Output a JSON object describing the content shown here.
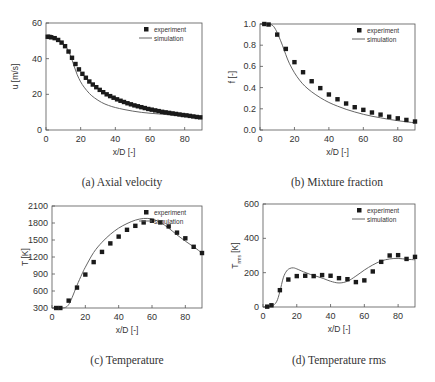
{
  "chart_data": [
    {
      "id": "a",
      "type": "scatter+line",
      "title": "",
      "caption": "(a) Axial velocity",
      "xlabel": "x/D [-]",
      "ylabel": "u [m/s]",
      "xlim": [
        0,
        90
      ],
      "ylim": [
        0,
        60
      ],
      "xticks": [
        0,
        20,
        40,
        60,
        80
      ],
      "yticks": [
        0,
        20,
        40,
        60
      ],
      "grid": false,
      "legend_position": "upper right",
      "series": [
        {
          "name": "experiment",
          "style": "square-markers",
          "x": [
            1,
            2,
            3,
            5,
            7,
            9,
            11,
            13,
            15,
            17,
            19,
            21,
            23,
            25,
            27,
            29,
            31,
            33,
            35,
            37,
            39,
            41,
            43,
            45,
            47,
            49,
            51,
            53,
            55,
            57,
            59,
            61,
            63,
            65,
            67,
            69,
            71,
            73,
            75,
            77,
            79,
            81,
            83,
            85,
            87,
            89
          ],
          "values": [
            52.3,
            52.2,
            52,
            51.5,
            50.5,
            49,
            47,
            44,
            40.5,
            37,
            34,
            31.5,
            29.3,
            27.2,
            25.5,
            24,
            22.5,
            21.2,
            20,
            19,
            18.1,
            17.2,
            16.4,
            15.7,
            15,
            14.4,
            13.8,
            13.3,
            12.8,
            12.3,
            11.8,
            11.4,
            11,
            10.6,
            10.2,
            9.9,
            9.6,
            9.3,
            9,
            8.7,
            8.4,
            8.2,
            7.9,
            7.6,
            7.3,
            7.1
          ]
        },
        {
          "name": "simulation",
          "style": "line",
          "x": [
            0,
            4,
            8,
            10,
            12,
            14,
            16,
            18,
            20,
            22,
            25,
            28,
            32,
            36,
            40,
            45,
            50,
            55,
            60,
            65,
            70,
            75,
            80,
            85,
            90
          ],
          "values": [
            52.5,
            52,
            50,
            48.5,
            46,
            42,
            36.5,
            31,
            27,
            24,
            20.5,
            18,
            15.5,
            13.8,
            12.6,
            11.5,
            10.6,
            9.9,
            9.4,
            9,
            8.6,
            8.2,
            7.8,
            7.4,
            7
          ]
        }
      ]
    },
    {
      "id": "b",
      "type": "scatter+line",
      "title": "",
      "caption": "(b) Mixture fraction",
      "xlabel": "x/D [-]",
      "ylabel": "f [-]",
      "xlim": [
        0,
        90
      ],
      "ylim": [
        0.0,
        1.0
      ],
      "xticks": [
        0,
        20,
        40,
        60,
        80
      ],
      "yticks": [
        0.0,
        0.2,
        0.4,
        0.6,
        0.8,
        1.0
      ],
      "grid": false,
      "legend_position": "upper right",
      "series": [
        {
          "name": "experiment",
          "style": "square-markers",
          "x": [
            2.5,
            5,
            10,
            15,
            20,
            25,
            30,
            35,
            40,
            45,
            50,
            55,
            60,
            65,
            70,
            75,
            80,
            85,
            90
          ],
          "values": [
            1.0,
            0.995,
            0.9,
            0.765,
            0.64,
            0.545,
            0.46,
            0.395,
            0.335,
            0.29,
            0.25,
            0.215,
            0.19,
            0.165,
            0.145,
            0.125,
            0.11,
            0.095,
            0.08
          ]
        },
        {
          "name": "simulation",
          "style": "line",
          "x": [
            0,
            4,
            7,
            9,
            11,
            13,
            15,
            17,
            20,
            23,
            26,
            30,
            35,
            40,
            45,
            50,
            55,
            60,
            65,
            70,
            75,
            80,
            85,
            90
          ],
          "values": [
            1.0,
            1.0,
            0.99,
            0.95,
            0.88,
            0.8,
            0.71,
            0.63,
            0.54,
            0.47,
            0.415,
            0.36,
            0.305,
            0.26,
            0.225,
            0.195,
            0.17,
            0.148,
            0.13,
            0.115,
            0.1,
            0.088,
            0.077,
            0.068
          ]
        }
      ]
    },
    {
      "id": "c",
      "type": "scatter+line",
      "title": "",
      "caption": "(c) Temperature",
      "xlabel": "x/D [-]",
      "ylabel": "T [K]",
      "xlim": [
        0,
        90
      ],
      "ylim": [
        300,
        2100
      ],
      "xticks": [
        0,
        20,
        40,
        60,
        80
      ],
      "yticks": [
        300,
        600,
        900,
        1200,
        1500,
        1800,
        2100
      ],
      "grid": false,
      "legend_position": "upper right",
      "series": [
        {
          "name": "experiment",
          "style": "square-markers",
          "x": [
            2.5,
            5,
            10,
            15,
            20,
            25,
            30,
            35,
            40,
            45,
            50,
            55,
            60,
            65,
            70,
            75,
            80,
            85,
            90
          ],
          "values": [
            300,
            300,
            430,
            660,
            890,
            1110,
            1290,
            1440,
            1560,
            1680,
            1750,
            1810,
            1840,
            1810,
            1740,
            1630,
            1530,
            1380,
            1270
          ]
        },
        {
          "name": "simulation",
          "style": "line",
          "x": [
            0,
            5,
            8,
            10,
            12,
            15,
            18,
            20,
            25,
            30,
            35,
            40,
            45,
            50,
            55,
            60,
            65,
            70,
            75,
            80,
            85,
            90
          ],
          "values": [
            300,
            300,
            310,
            360,
            480,
            700,
            900,
            1020,
            1280,
            1460,
            1600,
            1710,
            1790,
            1850,
            1880,
            1870,
            1810,
            1710,
            1590,
            1480,
            1380,
            1270
          ]
        }
      ]
    },
    {
      "id": "d",
      "type": "scatter+line",
      "title": "",
      "caption": "(d) Temperature rms",
      "xlabel": "x/D [-]",
      "ylabel": "T_rms [K]",
      "xlim": [
        0,
        90
      ],
      "ylim": [
        0,
        600
      ],
      "xticks": [
        0,
        20,
        40,
        60,
        80
      ],
      "yticks": [
        0,
        200,
        400,
        600
      ],
      "grid": false,
      "legend_position": "upper right",
      "series": [
        {
          "name": "experiment",
          "style": "square-markers",
          "x": [
            2.5,
            5,
            10,
            15,
            20,
            25,
            30,
            35,
            40,
            45,
            50,
            55,
            60,
            65,
            70,
            75,
            80,
            85,
            90
          ],
          "values": [
            2,
            10,
            98,
            160,
            180,
            182,
            180,
            186,
            182,
            168,
            162,
            145,
            155,
            207,
            263,
            300,
            302,
            280,
            292
          ]
        },
        {
          "name": "simulation",
          "style": "line",
          "x": [
            0,
            5,
            8,
            10,
            12,
            14,
            16,
            18,
            20,
            24,
            28,
            32,
            36,
            40,
            45,
            50,
            55,
            60,
            65,
            70,
            75,
            80,
            85,
            90
          ],
          "values": [
            0,
            5,
            30,
            90,
            170,
            210,
            225,
            228,
            222,
            205,
            190,
            178,
            165,
            150,
            140,
            150,
            180,
            215,
            245,
            268,
            280,
            283,
            278,
            275
          ]
        }
      ]
    }
  ],
  "legend": {
    "experiment": "experiment",
    "simulation": "simulation"
  },
  "captions": {
    "a": "(a) Axial velocity",
    "b": "(b) Mixture fraction",
    "c": "(c) Temperature",
    "d": "(d) Temperature rms"
  },
  "axis_labels": {
    "a_x": "x/D [-]",
    "a_y": "u [m/s]",
    "b_x": "x/D [-]",
    "b_y": "f [-]",
    "c_x": "x/D [-]",
    "c_y": "T [K]",
    "d_x": "x/D [-]",
    "d_y_main": "T",
    "d_y_sub": "rms",
    "d_y_unit": "[K]"
  },
  "colors": {
    "marker": "#1a1a1a",
    "line": "#666666",
    "axis": "#555555",
    "text": "#333333"
  }
}
